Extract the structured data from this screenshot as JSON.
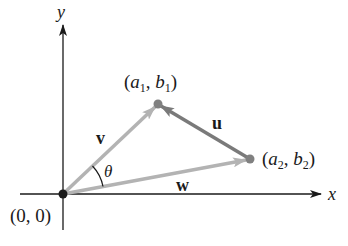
{
  "diagram": {
    "axes": {
      "x_label": "x",
      "y_label": "y",
      "origin_label": "(0, 0)"
    },
    "points": {
      "origin": {
        "label": "(0, 0)"
      },
      "p1": {
        "label_a": "a",
        "label_a_sub": "1",
        "label_b": "b",
        "label_b_sub": "1"
      },
      "p2": {
        "label_a": "a",
        "label_a_sub": "2",
        "label_b": "b",
        "label_b_sub": "2"
      }
    },
    "vectors": {
      "v": {
        "label": "v",
        "from": "origin",
        "to": "p1",
        "color": "#b3b3b3"
      },
      "w": {
        "label": "w",
        "from": "origin",
        "to": "p2",
        "color": "#b3b3b3"
      },
      "u": {
        "label": "u",
        "from": "p2",
        "to": "p1",
        "color": "#7a7a7a"
      }
    },
    "angle": {
      "label": "θ",
      "between": [
        "v",
        "w"
      ]
    },
    "colors": {
      "axis": "#1a1a1a",
      "light_vector": "#b3b3b3",
      "dark_vector": "#7a7a7a",
      "point": "#808080",
      "origin_point": "#1a1a1a"
    }
  }
}
